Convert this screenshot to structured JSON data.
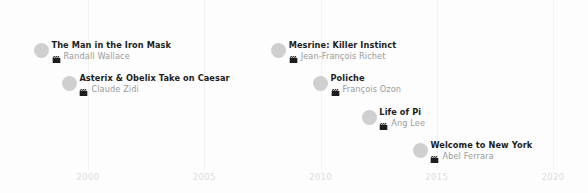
{
  "chart_data": {
    "type": "scatter",
    "title": "",
    "subtitle": "",
    "xlabel": "",
    "ylabel": "",
    "xlim": [
      1996.8,
      2021.5
    ],
    "grid": true,
    "legend": "none",
    "x_ticks": [
      "2000",
      "2005",
      "2010",
      "2015",
      "2020"
    ],
    "x_tick_values": [
      2000,
      2005,
      2010,
      2015,
      2020
    ],
    "marker_icon": "clapperboard-icon",
    "colors": {
      "background": "#fdfdfd",
      "gridline": "#f1f1f1",
      "tick_label": "#dcdcdc",
      "marker": "#cfcfcf",
      "title_text": "#1c1c1c",
      "director_text": "#9a9a9a",
      "icon": "#1c1c1c"
    },
    "points": [
      {
        "title": "The Man in the Iron Mask",
        "director": "Randall Wallace",
        "x": 1998,
        "row": 0
      },
      {
        "title": "Asterix & Obelix Take on Caesar",
        "director": "Claude Zidi",
        "x": 1999.2,
        "row": 1
      },
      {
        "title": "Mesrine: Killer Instinct",
        "director": "Jean-François Richet",
        "x": 2008.2,
        "row": 0
      },
      {
        "title": "Poliche",
        "director": "François Ozon",
        "x": 2010,
        "row": 1
      },
      {
        "title": "Life of Pi",
        "director": "Ang Lee",
        "x": 2012.1,
        "row": 2
      },
      {
        "title": "Welcome to New York",
        "director": "Abel Ferrara",
        "x": 2014.3,
        "row": 3
      }
    ]
  }
}
